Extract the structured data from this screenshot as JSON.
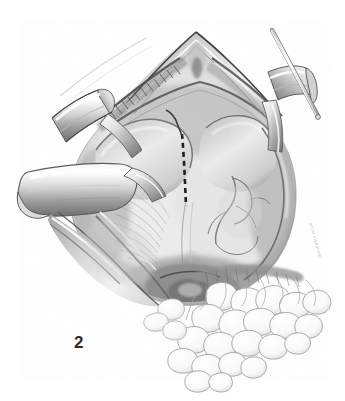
{
  "figure": {
    "number_label": "2",
    "caption": "",
    "medium": "graphite pencil drawing",
    "background_color": "#ffffff",
    "ink_color": "#2b2b2b",
    "midtone_color": "#8d8d8d",
    "highlight_color": "#fbfbfb",
    "signature": "artist signature"
  },
  "elements": {
    "retractor_upper_left_label": "upper left retractor blade",
    "retractor_lower_left_label": "lower left retractor blade",
    "retractor_right_label": "right retractor blade",
    "probe_label": "thin probe instrument",
    "incision_line_label": "dashed incision line",
    "wound_apex_label": "wound apex",
    "suture_edge_label": "sutured wound margin",
    "fat_tissue_label": "fatty omental tissue",
    "vessel_label": "vessel branch",
    "tissue_field_label": "exposed tissue field"
  },
  "colors": {
    "paper": "#ffffff",
    "darkest": "#232323",
    "dark": "#4a4a4a",
    "mid": "#8f8f8f",
    "light": "#c9c9c9",
    "faint": "#e8e8e8"
  }
}
